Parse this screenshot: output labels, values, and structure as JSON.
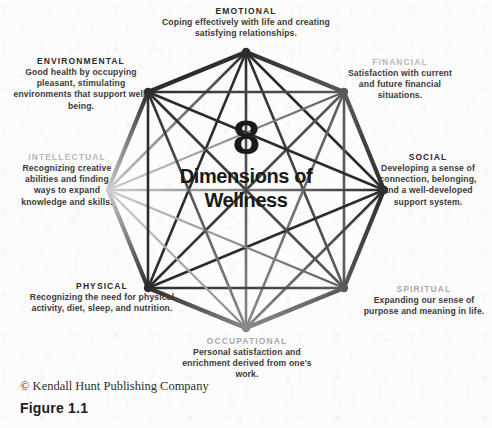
{
  "figure": {
    "center": {
      "number": "8",
      "line1": "Dimensions of",
      "line2": "Wellness"
    },
    "footer": {
      "copyright": "© Kendall Hunt Publishing Company",
      "figure_label": "Figure 1.1"
    },
    "dimensions": [
      {
        "id": "emotional",
        "title": "EMOTIONAL",
        "body": "Coping effectively with life and creating satisfying relationships.",
        "position": "top",
        "title_tone": "dark"
      },
      {
        "id": "financial",
        "title": "FINANCIAL",
        "body": "Satisfaction with current and future financial situations.",
        "position": "top-right",
        "title_tone": "faded"
      },
      {
        "id": "social",
        "title": "SOCIAL",
        "body": "Developing a sense of connection, belonging, and a well-developed support system.",
        "position": "right",
        "title_tone": "dark"
      },
      {
        "id": "spiritual",
        "title": "SPIRITUAL",
        "body": "Expanding our sense of purpose and meaning in life.",
        "position": "bottom-right",
        "title_tone": "semifaded"
      },
      {
        "id": "occupational",
        "title": "OCCUPATIONAL",
        "body": "Personal satisfaction and enrichment derived from one's work.",
        "position": "bottom",
        "title_tone": "semifaded"
      },
      {
        "id": "physical",
        "title": "PHYSICAL",
        "body": "Recognizing the need for physical activity, diet, sleep, and nutrition.",
        "position": "bottom-left",
        "title_tone": "dark"
      },
      {
        "id": "intellectual",
        "title": "INTELLECTUAL",
        "body": "Recognizing creative abilities and finding ways to expand knowledge and skills.",
        "position": "left",
        "title_tone": "faded"
      },
      {
        "id": "environmental",
        "title": "ENVIRONMENTAL",
        "body": "Good health by occupying pleasant, stimulating environments that support well-being.",
        "position": "top-left",
        "title_tone": "dark"
      }
    ]
  },
  "chart_data": {
    "type": "diagram",
    "shape": "octagon-complete-graph",
    "title": "8 Dimensions of Wellness",
    "vertex_count": 8,
    "center": [
      246,
      190
    ],
    "radius": 138,
    "vertices": [
      {
        "label": "EMOTIONAL",
        "angle_deg": 270,
        "x": 246,
        "y": 52,
        "tone": "dark"
      },
      {
        "label": "FINANCIAL",
        "angle_deg": 315,
        "x": 344,
        "y": 92,
        "tone": "mid"
      },
      {
        "label": "SOCIAL",
        "angle_deg": 0,
        "x": 384,
        "y": 190,
        "tone": "dark"
      },
      {
        "label": "SPIRITUAL",
        "angle_deg": 45,
        "x": 344,
        "y": 288,
        "tone": "mid"
      },
      {
        "label": "OCCUPATIONAL",
        "angle_deg": 90,
        "x": 246,
        "y": 328,
        "tone": "light"
      },
      {
        "label": "PHYSICAL",
        "angle_deg": 135,
        "x": 148,
        "y": 288,
        "tone": "dark"
      },
      {
        "label": "INTELLECTUAL",
        "angle_deg": 180,
        "x": 108,
        "y": 190,
        "tone": "very-light"
      },
      {
        "label": "ENVIRONMENTAL",
        "angle_deg": 225,
        "x": 148,
        "y": 92,
        "tone": "dark"
      }
    ],
    "edges": "all-pairs",
    "edge_count": 28,
    "colors": {
      "background": "#fcfcfc",
      "line_dark": "#2a2a2a",
      "line_light": "#dcdcdc",
      "text_dark": "#2b2b2b",
      "text_faded": "#b9b9b9"
    }
  }
}
